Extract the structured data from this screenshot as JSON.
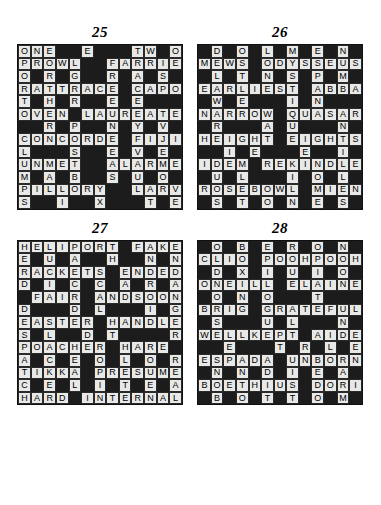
{
  "page": {
    "background_color": "#ffffff",
    "grid_size": 13,
    "cell_colors": {
      "white_cell": "#e8e8e6",
      "black_cell": "#1c1c1c",
      "letter_color": "#000000"
    }
  },
  "puzzles": [
    {
      "number": "25",
      "rows": [
        "ONE##E###TW#O",
        "PROWL##FARRIER",
        "O#R#G##R#A#S#A",
        "RATTRACE#CAPON",
        "T#H#R##E#E###G",
        "OVEN#LAUREATE",
        "##R#P##N#Y#V#",
        "CONCORDE#FIJI",
        "L###S##E#V#E#N",
        "UNMET##ALARMED",
        "M#A#B##S#U#O#I",
        "PILLORY##LARVA",
        "S##I##X###T#E#N"
      ],
      "grid": [
        [
          "O",
          "N",
          "E",
          "#",
          "#",
          "E",
          "#",
          "#",
          "#",
          "T",
          "W",
          "#",
          "O"
        ],
        [
          "P",
          "R",
          "O",
          "W",
          "L",
          "#",
          "#",
          "F",
          "A",
          "R",
          "R",
          "I",
          "E"
        ],
        [
          "O",
          "#",
          "R",
          "#",
          "G",
          "#",
          "#",
          "R",
          "#",
          "A",
          "#",
          "S",
          "#"
        ],
        [
          "R",
          "A",
          "T",
          "T",
          "R",
          "A",
          "C",
          "E",
          "#",
          "C",
          "A",
          "P",
          "O"
        ],
        [
          "T",
          "#",
          "H",
          "#",
          "R",
          "#",
          "#",
          "E",
          "#",
          "E",
          "#",
          "#",
          "#"
        ],
        [
          "O",
          "V",
          "E",
          "N",
          "#",
          "L",
          "A",
          "U",
          "R",
          "E",
          "A",
          "T",
          "E"
        ],
        [
          "#",
          "#",
          "R",
          "#",
          "P",
          "#",
          "#",
          "N",
          "#",
          "Y",
          "#",
          "V",
          "#"
        ],
        [
          "C",
          "O",
          "N",
          "C",
          "O",
          "R",
          "D",
          "E",
          "#",
          "F",
          "I",
          "J",
          "I"
        ],
        [
          "L",
          "#",
          "#",
          "#",
          "S",
          "#",
          "#",
          "E",
          "#",
          "V",
          "#",
          "E",
          "#"
        ],
        [
          "U",
          "N",
          "M",
          "E",
          "T",
          "#",
          "#",
          "A",
          "L",
          "A",
          "R",
          "M",
          "E"
        ],
        [
          "M",
          "#",
          "A",
          "#",
          "B",
          "#",
          "#",
          "S",
          "#",
          "U",
          "#",
          "O",
          "#"
        ],
        [
          "P",
          "I",
          "L",
          "L",
          "O",
          "R",
          "Y",
          "#",
          "#",
          "L",
          "A",
          "R",
          "V"
        ],
        [
          "S",
          "#",
          "#",
          "I",
          "#",
          "#",
          "X",
          "#",
          "#",
          "#",
          "T",
          "#",
          "E"
        ]
      ]
    },
    {
      "number": "26",
      "rows": [
        "#DOLMEN",
        "MEWS ODYSSEUS",
        "LTNSPM",
        "EARLIEST ABBA",
        "WEIN",
        "NARROW QUASAR",
        "RAUN",
        "HEIGHT EIGHTS",
        "IEEL",
        "IDEM REKINDLE",
        "ULILS",
        "ROSEBOWL MIEN",
        "STONES"
      ],
      "grid": [
        [
          "#",
          "D",
          "#",
          "O",
          "#",
          "L",
          "#",
          "M",
          "#",
          "E",
          "#",
          "N",
          "#"
        ],
        [
          "M",
          "E",
          "W",
          "S",
          "#",
          "O",
          "D",
          "Y",
          "S",
          "S",
          "E",
          "U",
          "S"
        ],
        [
          "#",
          "L",
          "#",
          "T",
          "#",
          "N",
          "#",
          "S",
          "#",
          "P",
          "#",
          "M",
          "#"
        ],
        [
          "E",
          "A",
          "R",
          "L",
          "I",
          "E",
          "S",
          "T",
          "#",
          "A",
          "B",
          "B",
          "A"
        ],
        [
          "#",
          "W",
          "#",
          "E",
          "#",
          "#",
          "#",
          "I",
          "#",
          "N",
          "#",
          "#",
          "#"
        ],
        [
          "N",
          "A",
          "R",
          "R",
          "O",
          "W",
          "#",
          "Q",
          "U",
          "A",
          "S",
          "A",
          "R"
        ],
        [
          "#",
          "R",
          "#",
          "#",
          "#",
          "A",
          "#",
          "U",
          "#",
          "#",
          "#",
          "N",
          "#"
        ],
        [
          "H",
          "E",
          "I",
          "G",
          "H",
          "T",
          "#",
          "E",
          "I",
          "G",
          "H",
          "T",
          "S"
        ],
        [
          "#",
          "#",
          "I",
          "#",
          "E",
          "#",
          "#",
          "#",
          "E",
          "#",
          "#",
          "I",
          "#"
        ],
        [
          "I",
          "D",
          "E",
          "M",
          "#",
          "R",
          "E",
          "K",
          "I",
          "N",
          "D",
          "L",
          "E"
        ],
        [
          "#",
          "U",
          "#",
          "L",
          "#",
          "#",
          "#",
          "I",
          "#",
          "O",
          "#",
          "L",
          "#"
        ],
        [
          "R",
          "O",
          "S",
          "E",
          "B",
          "O",
          "W",
          "L",
          "#",
          "M",
          "I",
          "E",
          "N"
        ],
        [
          "#",
          "S",
          "#",
          "T",
          "#",
          "O",
          "#",
          "N",
          "#",
          "E",
          "#",
          "S",
          "#"
        ]
      ]
    },
    {
      "number": "27",
      "rows": [
        "HELIPORT FAKE",
        "EUAHNN",
        "RACKETS ENDED",
        "DICCARA",
        "FAIR ANDSOON",
        "DDLIG",
        "EASTER HANDLE",
        "SLDTR",
        "POACHER HARE",
        "ACEOOR",
        "TIKKA PRESUME",
        "CELITEA",
        "HARD INTERNAL"
      ],
      "grid": [
        [
          "H",
          "E",
          "L",
          "I",
          "P",
          "O",
          "R",
          "T",
          "#",
          "F",
          "A",
          "K",
          "E"
        ],
        [
          "E",
          "#",
          "U",
          "#",
          "A",
          "#",
          "#",
          "H",
          "#",
          "#",
          "N",
          "#",
          "N"
        ],
        [
          "R",
          "A",
          "C",
          "K",
          "E",
          "T",
          "S",
          "#",
          "E",
          "N",
          "D",
          "E",
          "D"
        ],
        [
          "D",
          "#",
          "I",
          "#",
          "C",
          "#",
          "C",
          "#",
          "A",
          "#",
          "R",
          "#",
          "A"
        ],
        [
          "#",
          "F",
          "A",
          "I",
          "R",
          "#",
          "A",
          "N",
          "D",
          "S",
          "O",
          "O",
          "N"
        ],
        [
          "D",
          "#",
          "#",
          "#",
          "D",
          "#",
          "L",
          "#",
          "#",
          "#",
          "I",
          "#",
          "G"
        ],
        [
          "E",
          "A",
          "S",
          "T",
          "E",
          "R",
          "#",
          "H",
          "A",
          "N",
          "D",
          "L",
          "E"
        ],
        [
          "S",
          "#",
          "L",
          "#",
          "#",
          "D",
          "#",
          "T",
          "#",
          "#",
          "#",
          "#",
          "R"
        ],
        [
          "P",
          "O",
          "A",
          "C",
          "H",
          "E",
          "R",
          "#",
          "H",
          "A",
          "R",
          "E",
          "#"
        ],
        [
          "A",
          "#",
          "C",
          "#",
          "E",
          "#",
          "O",
          "#",
          "L",
          "#",
          "O",
          "#",
          "R"
        ],
        [
          "T",
          "I",
          "K",
          "K",
          "A",
          "#",
          "P",
          "R",
          "E",
          "S",
          "U",
          "M",
          "E"
        ],
        [
          "C",
          "#",
          "E",
          "#",
          "L",
          "#",
          "I",
          "#",
          "T",
          "#",
          "E",
          "#",
          "A"
        ],
        [
          "H",
          "A",
          "R",
          "D",
          "#",
          "I",
          "N",
          "T",
          "E",
          "R",
          "N",
          "A",
          "L"
        ]
      ]
    },
    {
      "number": "28",
      "rows": [
        "OBERON",
        "CLIO POOHPOOH",
        "DXIUIO",
        "ONEILL ELAINE",
        "ONOT",
        "BRIG GRATEFUL",
        "SULN",
        "WELLKEPT AIDE",
        "ETLE",
        "ESPADA UNBORN",
        "NNDEA",
        "BOETHIUS DORIA",
        "BOTTOM"
      ],
      "grid": [
        [
          "#",
          "O",
          "#",
          "B",
          "#",
          "E",
          "#",
          "R",
          "#",
          "O",
          "#",
          "N",
          "#"
        ],
        [
          "C",
          "L",
          "I",
          "O",
          "#",
          "P",
          "O",
          "O",
          "H",
          "P",
          "O",
          "O",
          "H"
        ],
        [
          "#",
          "D",
          "#",
          "X",
          "#",
          "I",
          "#",
          "U",
          "#",
          "I",
          "#",
          "O",
          "#"
        ],
        [
          "O",
          "N",
          "E",
          "I",
          "L",
          "L",
          "#",
          "E",
          "L",
          "A",
          "I",
          "N",
          "E"
        ],
        [
          "#",
          "O",
          "#",
          "N",
          "#",
          "O",
          "#",
          "#",
          "#",
          "T",
          "#",
          "#",
          "#"
        ],
        [
          "B",
          "R",
          "I",
          "G",
          "#",
          "G",
          "R",
          "A",
          "T",
          "E",
          "F",
          "U",
          "L"
        ],
        [
          "#",
          "S",
          "#",
          "#",
          "#",
          "U",
          "#",
          "L",
          "#",
          "#",
          "#",
          "N",
          "#"
        ],
        [
          "W",
          "E",
          "L",
          "L",
          "K",
          "E",
          "P",
          "T",
          "#",
          "A",
          "I",
          "D",
          "E"
        ],
        [
          "#",
          "#",
          "E",
          "#",
          "#",
          "#",
          "T",
          "#",
          "R",
          "#",
          "L",
          "#",
          "E"
        ],
        [
          "E",
          "S",
          "P",
          "A",
          "D",
          "A",
          "#",
          "U",
          "N",
          "B",
          "O",
          "R",
          "N"
        ],
        [
          "#",
          "N",
          "#",
          "N",
          "#",
          "D",
          "#",
          "I",
          "#",
          "E",
          "#",
          "A",
          "#"
        ],
        [
          "B",
          "O",
          "E",
          "T",
          "H",
          "I",
          "U",
          "S",
          "#",
          "D",
          "O",
          "R",
          "I"
        ],
        [
          "#",
          "B",
          "#",
          "O",
          "#",
          "T",
          "#",
          "T",
          "#",
          "O",
          "#",
          "M",
          "#"
        ]
      ]
    }
  ]
}
